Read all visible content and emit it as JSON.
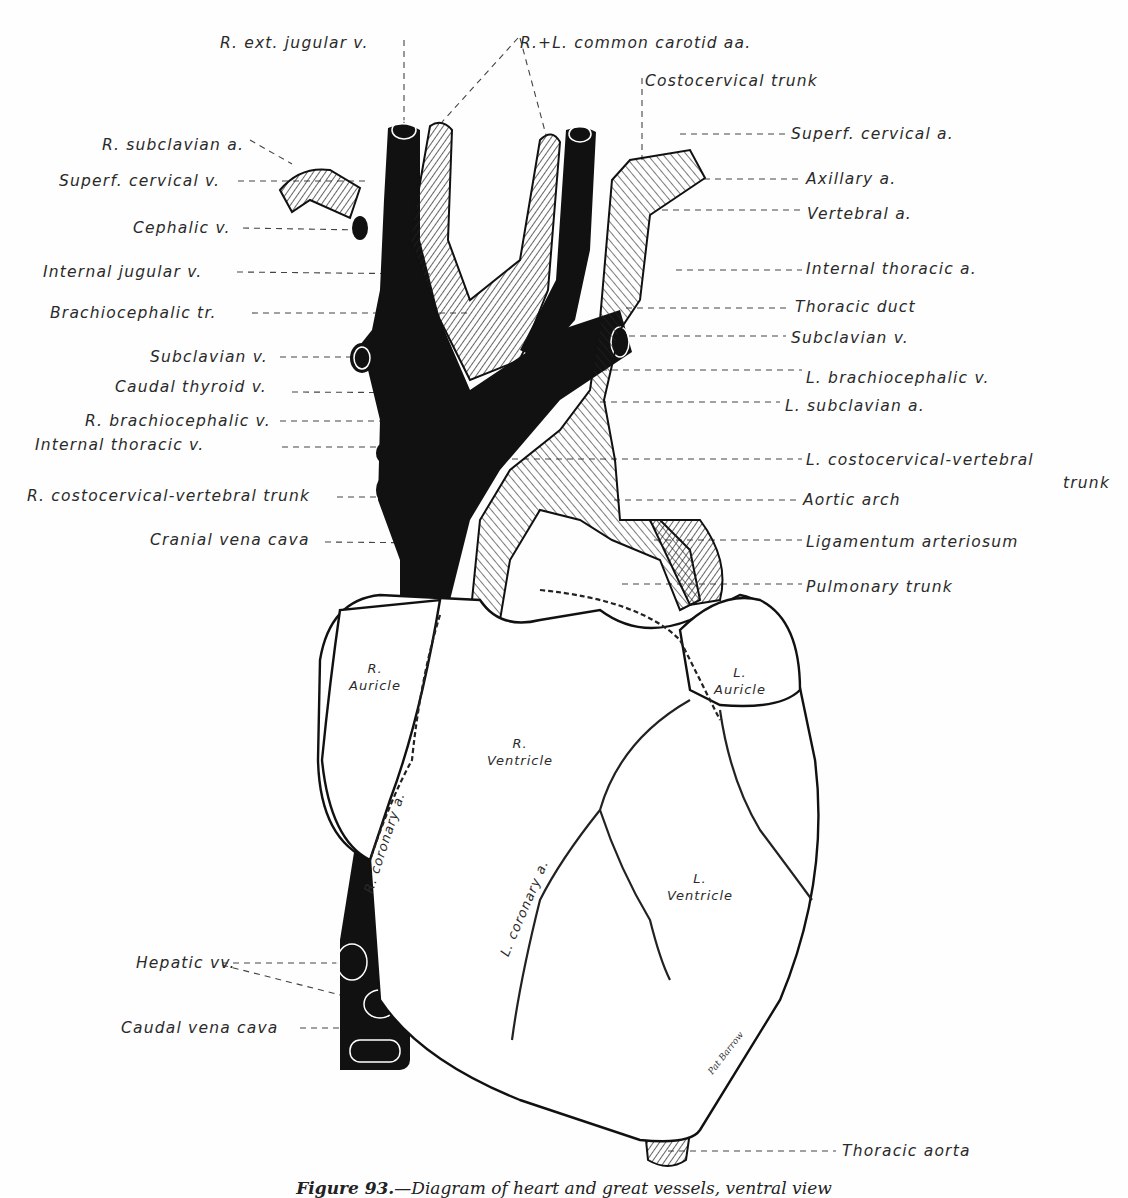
{
  "figure": {
    "caption_label": "Figure 93.",
    "caption_text": "—Diagram of heart and great vessels, ventral view",
    "signature": "Pat Barrow"
  },
  "labels_left": [
    {
      "text": "R. ext. jugular v.",
      "x": 220,
      "y": 34
    },
    {
      "text": "R. subclavian a.",
      "x": 102,
      "y": 136
    },
    {
      "text": "Superf. cervical v.",
      "x": 59,
      "y": 172
    },
    {
      "text": "Cephalic v.",
      "x": 133,
      "y": 219
    },
    {
      "text": "Internal jugular v.",
      "x": 43,
      "y": 263
    },
    {
      "text": "Brachiocephalic tr.",
      "x": 50,
      "y": 304
    },
    {
      "text": "Subclavian v.",
      "x": 150,
      "y": 348
    },
    {
      "text": "Caudal thyroid v.",
      "x": 115,
      "y": 378
    },
    {
      "text": "R. brachiocephalic v.",
      "x": 85,
      "y": 412
    },
    {
      "text": "Internal thoracic v.",
      "x": 35,
      "y": 436
    },
    {
      "text": "R. costocervical-vertebral trunk",
      "x": 27,
      "y": 487
    },
    {
      "text": "Cranial vena cava",
      "x": 150,
      "y": 531
    },
    {
      "text": "Hepatic vv.",
      "x": 136,
      "y": 954
    },
    {
      "text": "Caudal vena cava",
      "x": 121,
      "y": 1019
    }
  ],
  "labels_right": [
    {
      "text": "R.+L. common carotid aa.",
      "x": 520,
      "y": 34
    },
    {
      "text": "Costocervical trunk",
      "x": 645,
      "y": 72
    },
    {
      "text": "Superf. cervical a.",
      "x": 791,
      "y": 125
    },
    {
      "text": "Axillary a.",
      "x": 806,
      "y": 170
    },
    {
      "text": "Vertebral a.",
      "x": 807,
      "y": 205
    },
    {
      "text": "Internal thoracic a.",
      "x": 806,
      "y": 260
    },
    {
      "text": "Thoracic duct",
      "x": 795,
      "y": 298
    },
    {
      "text": "Subclavian v.",
      "x": 791,
      "y": 329
    },
    {
      "text": "L. brachiocephalic v.",
      "x": 806,
      "y": 369
    },
    {
      "text": "L. subclavian a.",
      "x": 785,
      "y": 397
    },
    {
      "text": "L. costocervical-vertebral",
      "x": 806,
      "y": 451
    },
    {
      "text": "trunk",
      "x": 1063,
      "y": 474
    },
    {
      "text": "Aortic arch",
      "x": 803,
      "y": 491
    },
    {
      "text": "Ligamentum arteriosum",
      "x": 806,
      "y": 533
    },
    {
      "text": "Pulmonary trunk",
      "x": 806,
      "y": 578
    },
    {
      "text": "Thoracic aorta",
      "x": 842,
      "y": 1142
    }
  ],
  "inner_labels": [
    {
      "text": "R.\nAuricle",
      "x": 340,
      "y": 660
    },
    {
      "text": "R.\nVentricle",
      "x": 480,
      "y": 735
    },
    {
      "text": "L.\nAuricle",
      "x": 710,
      "y": 664
    },
    {
      "text": "L.\nVentricle",
      "x": 656,
      "y": 870
    }
  ],
  "vessel_labels": [
    {
      "text": "R. coronary a.",
      "x": 368,
      "y": 885,
      "rotate": -72
    },
    {
      "text": "L. coronary a.",
      "x": 504,
      "y": 948,
      "rotate": -67
    }
  ],
  "colors": {
    "ink": "#111111",
    "paper": "#fefefe",
    "text": "#2a2a2a"
  }
}
